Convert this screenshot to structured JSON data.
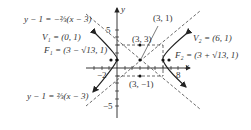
{
  "diagram": {
    "type": "hyperbola",
    "center": "(3, 1)",
    "axes_labels": {
      "x": "x",
      "y": "y"
    },
    "ticks": {
      "x_neg": "−2",
      "x_pos": "8",
      "y_pos": "5",
      "y_neg": "−5"
    },
    "points": {
      "center": "(3, 1)",
      "top": "(3, 3)",
      "bottom": "(3, −1)",
      "v1": "V₁ = (0, 1)",
      "v2": "V₂ = (6, 1)",
      "f1": "F₁ = (3 − √13, 1)",
      "f2": "F₂ = (3 + √13, 1)"
    },
    "asymptotes": {
      "upper": "y − 1 = −⅔(x − 3)",
      "lower": "y − 1 = ⅔(x − 3)"
    },
    "colors": {
      "stroke": "#222222",
      "dash": "#444444",
      "text": "#333333"
    }
  }
}
